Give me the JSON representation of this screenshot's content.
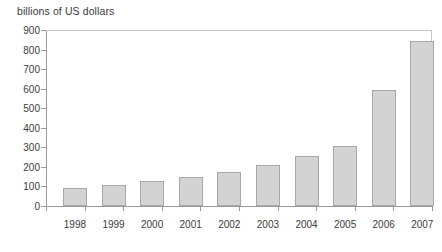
{
  "chart_data": {
    "type": "bar",
    "title": "billions of US dollars",
    "xlabel": "",
    "ylabel": "billions of US dollars",
    "categories": [
      "1998",
      "1999",
      "2000",
      "2001",
      "2002",
      "2003",
      "2004",
      "2005",
      "2006",
      "2007"
    ],
    "values": [
      93,
      105,
      126,
      146,
      172,
      212,
      254,
      308,
      595,
      845
    ],
    "ylim": [
      0,
      900
    ],
    "ytick_labels": [
      "900",
      "800",
      "700",
      "600",
      "500",
      "400",
      "300",
      "200",
      "100",
      "0"
    ],
    "ytick_values": [
      900,
      800,
      700,
      600,
      500,
      400,
      300,
      200,
      100,
      0
    ],
    "grid": false,
    "legend": null,
    "bar_color": "#d3d3d3",
    "bar_border_color": "#a9a9a9",
    "axis_color": "#9a9a9a",
    "text_color": "#3c3c3c"
  }
}
